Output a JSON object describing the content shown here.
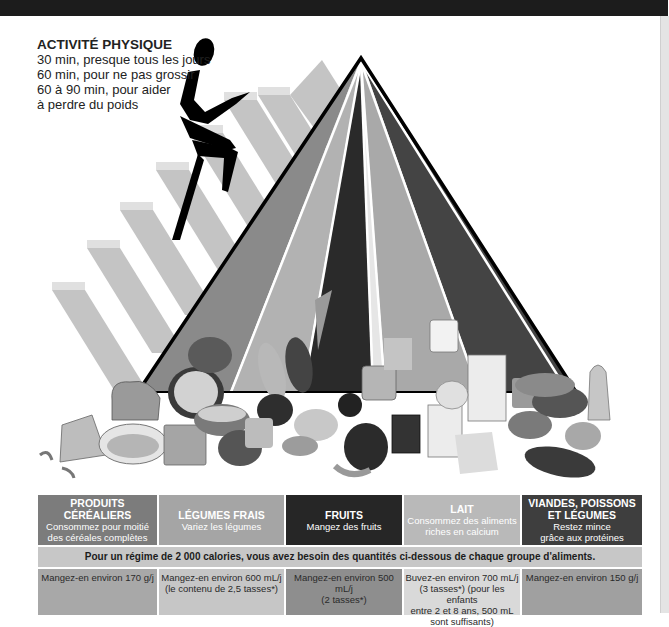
{
  "activity": {
    "title": "ACTIVITÉ PHYSIQUE",
    "lines": [
      "30 min, presque tous les jours",
      "60 min, pour ne pas grossir",
      "60 à 90 min, pour aider",
      "à perdre du poids"
    ]
  },
  "illustration": {
    "figure": "stair-climber-figure",
    "pyramid_colors": {
      "cereals": "#8a8a8a",
      "vegetables": "#b2b2b2",
      "fruits": "#2a2a2a",
      "oils": "#d8d8d8",
      "milk": "#a9a9a9",
      "meat": "#444444"
    },
    "food_labels": [
      "PEACHES",
      "RAISINS",
      "MILK",
      "1% MILK",
      "TUNA"
    ]
  },
  "groups": [
    {
      "title": "PRODUITS CÉRÉALIERS",
      "sub1": "Consommez pour moitié",
      "sub2": "des céréales complètes",
      "color": "#7c7c7c",
      "amount1": "Mangez-en environ 170 g/j",
      "amount2": "",
      "amount3": "",
      "amount4": "",
      "amount_color": "#a8a8a8",
      "text_color": "#ffffff"
    },
    {
      "title": "LÉGUMES FRAIS",
      "sub1": "Variez les légumes",
      "sub2": "",
      "color": "#a5a5a5",
      "amount1": "Mangez-en environ 600 mL/j",
      "amount2": "(le contenu de 2,5 tasses*)",
      "amount3": "",
      "amount4": "",
      "amount_color": "#c6c6c6",
      "text_color": "#ffffff"
    },
    {
      "title": "FRUITS",
      "sub1": "Mangez des fruits",
      "sub2": "",
      "color": "#262626",
      "amount1": "Mangez-en environ 500 mL/j",
      "amount2": "(2 tasses*)",
      "amount3": "",
      "amount4": "",
      "amount_color": "#8e8e8e",
      "text_color": "#ffffff"
    },
    {
      "title": "LAIT",
      "sub1": "Consommez des aliments",
      "sub2": "riches en calcium",
      "color": "#b9b9b9",
      "amount1": "Buvez-en environ 700 mL/j",
      "amount2": "(3 tasses*) (pour les enfants",
      "amount3": "entre 2 et 8 ans, 500 mL",
      "amount4": "sont suffisants)",
      "amount_color": "#d9d9d9",
      "text_color": "#ffffff"
    },
    {
      "title": "VIANDES, POISSONS",
      "title2": "ET LÉGUMES",
      "sub1": "Restez mince",
      "sub2": "grâce aux protéines",
      "color": "#3e3e3e",
      "amount1": "Mangez-en environ 150 g/j",
      "amount2": "",
      "amount3": "",
      "amount4": "",
      "amount_color": "#a0a0a0",
      "text_color": "#ffffff"
    }
  ],
  "banner": "Pour un régime de 2 000 calories, vous avez besoin des quantités ci-dessous de chaque groupe d'aliments."
}
